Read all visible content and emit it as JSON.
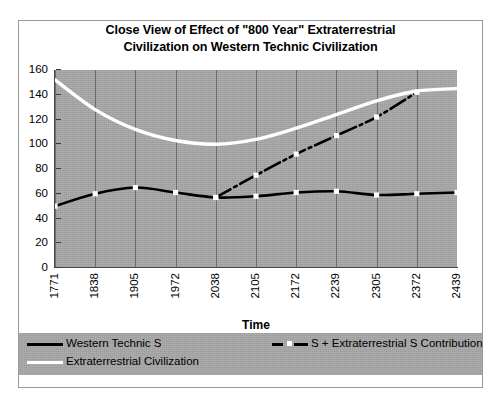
{
  "title": {
    "line1": "Close View of Effect of \"800 Year\" Extraterrestrial",
    "line2": "Civilization on Western Technic Civilization"
  },
  "axes": {
    "x_title": "Time",
    "y_ticks": [
      "160",
      "140",
      "120",
      "100",
      "80",
      "60",
      "40",
      "20",
      "0"
    ],
    "x_ticks": [
      "1771",
      "1838",
      "1905",
      "1972",
      "2038",
      "2105",
      "2172",
      "2239",
      "2305",
      "2372",
      "2439"
    ]
  },
  "legend": {
    "entries": [
      {
        "label": "Western Technic S",
        "style": "solid-black",
        "color": "#000000"
      },
      {
        "label": "S + Extraterrestrial S Contribution",
        "style": "dashed-black",
        "color": "#000000"
      },
      {
        "label": "Extraterrestrial Civilization",
        "style": "solid-white",
        "color": "#ffffff"
      }
    ]
  },
  "colors": {
    "plot_background": "#a8a8a8",
    "frame_border": "#9a9a9a",
    "gridline": "#6d6d6d",
    "western_technic": "#000000",
    "contribution": "#000000",
    "extraterrestrial": "#ffffff",
    "marker_fill": "#ffffff"
  },
  "chart_data": {
    "type": "line",
    "title": "Close View of Effect of \"800 Year\" Extraterrestrial Civilization on Western Technic Civilization",
    "xlabel": "Time",
    "ylabel": "",
    "categories": [
      "1771",
      "1838",
      "1905",
      "1972",
      "2038",
      "2105",
      "2172",
      "2239",
      "2305",
      "2372",
      "2439"
    ],
    "ylim": [
      0,
      160
    ],
    "ytick_step": 20,
    "grid": "vertical",
    "legend_position": "bottom",
    "series": [
      {
        "name": "Western Technic S",
        "style": "solid",
        "color": "#000000",
        "markers": true,
        "values": [
          50,
          60,
          65,
          61,
          57,
          58,
          61,
          62,
          59,
          60,
          61
        ]
      },
      {
        "name": "S + Extraterrestrial S Contribution",
        "style": "dashed",
        "color": "#000000",
        "markers": true,
        "values": [
          null,
          null,
          null,
          null,
          57,
          75,
          92,
          107,
          122,
          142,
          null
        ]
      },
      {
        "name": "Extraterrestrial Civilization",
        "style": "solid",
        "color": "#ffffff",
        "markers": false,
        "values": [
          152,
          128,
          112,
          103,
          100,
          104,
          113,
          124,
          135,
          143,
          145
        ]
      }
    ]
  }
}
